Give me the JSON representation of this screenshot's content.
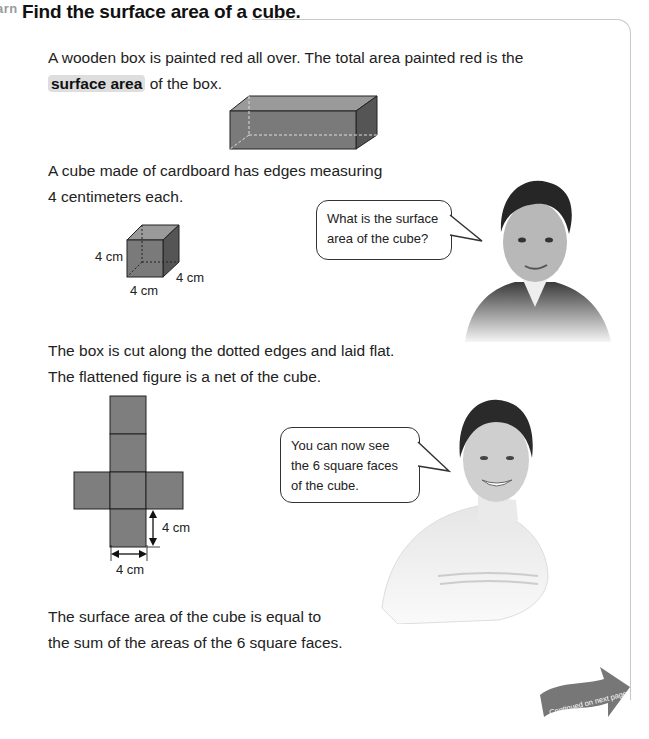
{
  "header": {
    "section_tag": "arn",
    "title": "Find the surface area of a cube."
  },
  "paragraphs": {
    "p1_before": "A wooden box is painted red all over. The total area painted red is the",
    "p1_keyword": "surface area",
    "p1_after": " of the box.",
    "p2_line1": "A cube made of cardboard has edges measuring",
    "p2_line2": "4 centimeters each.",
    "p3_line1": "The box is cut along the dotted edges and laid flat.",
    "p3_line2": "The flattened figure is a net of the cube.",
    "p4_line1": "The surface area of the cube is equal to",
    "p4_line2": "the sum of the areas of the 6 square faces."
  },
  "cube_figure": {
    "label_height": "4 cm",
    "label_depth": "4 cm",
    "label_width": "4 cm"
  },
  "net_figure": {
    "label_vertical": "4 cm",
    "label_horizontal": "4 cm",
    "face_count": 6
  },
  "speech": {
    "boy": "What is the surface area of the cube?",
    "girl": "You can now see the 6 square faces of the cube."
  },
  "footer": {
    "continued_label": "Continued on next page"
  },
  "colors": {
    "figure_fill": "#7a7a7a",
    "figure_top": "#9a9a9a",
    "figure_side": "#555555",
    "keyword_bg": "#dedede",
    "frame_border": "#c8c8c8",
    "arrow": "#777777"
  }
}
